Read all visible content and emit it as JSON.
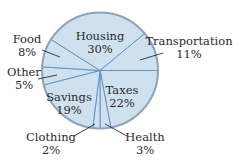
{
  "chart_data": {
    "type": "pie",
    "title": "",
    "categories": [
      "Taxes",
      "Health",
      "Clothing",
      "Savings",
      "Other",
      "Food",
      "Housing",
      "Transportation"
    ],
    "values": [
      22,
      3,
      2,
      19,
      5,
      8,
      30,
      11
    ],
    "unit": "%",
    "start_angle_deg": 0,
    "direction": "clockwise",
    "legend": "none",
    "labels": [
      {
        "name": "Taxes",
        "value": "22%",
        "position": "inside"
      },
      {
        "name": "Health",
        "value": "3%",
        "position": "outside"
      },
      {
        "name": "Clothing",
        "value": "2%",
        "position": "outside"
      },
      {
        "name": "Savings",
        "value": "19%",
        "position": "inside"
      },
      {
        "name": "Other",
        "value": "5%",
        "position": "outside"
      },
      {
        "name": "Food",
        "value": "8%",
        "position": "outside"
      },
      {
        "name": "Housing",
        "value": "30%",
        "position": "inside"
      },
      {
        "name": "Transportation",
        "value": "11%",
        "position": "outside"
      }
    ],
    "colors": {
      "fill": "#cfe0ee",
      "divider": "#5b8fc4",
      "rim": "#8ea4b8",
      "text": "#2a2a2a"
    }
  }
}
